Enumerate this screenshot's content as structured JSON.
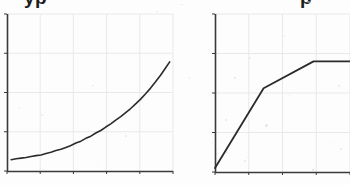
{
  "page": {
    "background_color": "#fdfdfd",
    "ink_color": "#2b2b2b",
    "grid_color": "#e9e9e9",
    "axis_color": "#3a3a3a",
    "width": 350,
    "height": 185
  },
  "headings": {
    "left_partial": "yp",
    "right_partial": "p"
  },
  "chart_data": [
    {
      "id": "left-chart",
      "type": "line",
      "title": "",
      "subtitle": "",
      "xlabel": "",
      "ylabel": "",
      "grid": true,
      "legend_position": "none",
      "annotations": [],
      "xlim": [
        0,
        10
      ],
      "ylim": [
        0,
        10
      ],
      "xticks": [
        0,
        2,
        4,
        6,
        8,
        10
      ],
      "yticks": [
        0,
        2.5,
        5,
        7.5,
        10
      ],
      "xticklabels": [
        "",
        "",
        "",
        "",
        "",
        ""
      ],
      "yticklabels": [
        "",
        "",
        "",
        "",
        ""
      ],
      "plot_box": {
        "x": 7,
        "y": 14,
        "width": 166,
        "height": 157
      },
      "series": [
        {
          "name": "rising-exponential",
          "color": "#2b2b2b",
          "line_width": 1.6,
          "x": [
            0.25,
            0.55,
            0.85,
            1.15,
            1.45,
            1.75,
            2.05,
            2.35,
            2.65,
            2.95,
            3.25,
            3.55,
            3.85,
            4.15,
            4.45,
            4.75,
            5.05,
            5.35,
            5.65,
            5.95,
            6.25,
            6.55,
            6.85,
            7.15,
            7.45,
            7.75,
            8.05,
            8.35,
            8.65,
            8.95,
            9.25,
            9.55,
            9.8
          ],
          "y": [
            0.72,
            0.78,
            0.82,
            0.86,
            0.92,
            0.98,
            1.02,
            1.12,
            1.2,
            1.3,
            1.38,
            1.5,
            1.62,
            1.78,
            1.9,
            2.08,
            2.22,
            2.42,
            2.58,
            2.8,
            3.0,
            3.24,
            3.46,
            3.72,
            3.98,
            4.28,
            4.58,
            4.92,
            5.28,
            5.68,
            6.1,
            6.56,
            6.95
          ]
        }
      ]
    },
    {
      "id": "right-chart",
      "type": "line",
      "title": "",
      "subtitle": "",
      "xlabel": "",
      "ylabel": "",
      "grid": true,
      "legend_position": "none",
      "annotations": [],
      "xlim": [
        0,
        10
      ],
      "ylim": [
        0,
        10
      ],
      "xticks": [
        0,
        2.5,
        5,
        7.5,
        10
      ],
      "yticks": [
        0,
        2.5,
        5,
        7.5,
        10
      ],
      "xticklabels": [
        "",
        "",
        "",
        "",
        ""
      ],
      "yticklabels": [
        "",
        "",
        "",
        "",
        ""
      ],
      "plot_box": {
        "x": 215,
        "y": 14,
        "width": 135,
        "height": 158
      },
      "series": [
        {
          "name": "saturating-piecewise",
          "color": "#2b2b2b",
          "line_width": 1.8,
          "x": [
            0.0,
            3.6,
            7.3,
            10.0
          ],
          "y": [
            0.25,
            5.3,
            7.0,
            7.0
          ]
        }
      ]
    }
  ]
}
